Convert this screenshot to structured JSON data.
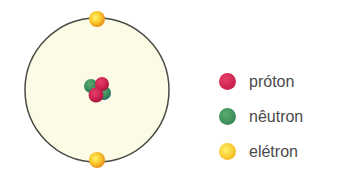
{
  "diagram": {
    "title": "",
    "orbit_color": "#4a4a44",
    "orbit_fill": "#fbfbe6",
    "legend": [
      {
        "label": "próton",
        "color": "#c8204e"
      },
      {
        "label": "nêutron",
        "color": "#3a8a5a"
      },
      {
        "label": "elétron",
        "color": "#f4b020"
      }
    ]
  }
}
